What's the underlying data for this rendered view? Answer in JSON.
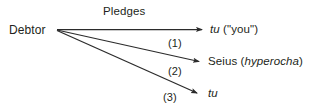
{
  "diagram": {
    "title": "Pledges",
    "source": {
      "label": "Debtor"
    },
    "arrows": [
      {
        "step_label": "(1)",
        "target_italic": "tu",
        "target_rest": " (\"you\")"
      },
      {
        "step_label": "(2)",
        "target_plain": "Seius (",
        "target_italic": "hyperocha",
        "target_rest": ")"
      },
      {
        "step_label": "(3)",
        "target_italic": "tu",
        "target_rest": ""
      }
    ],
    "colors": {
      "ink": "#231f20",
      "background": "#ffffff",
      "line": "#2b2b2b"
    }
  }
}
